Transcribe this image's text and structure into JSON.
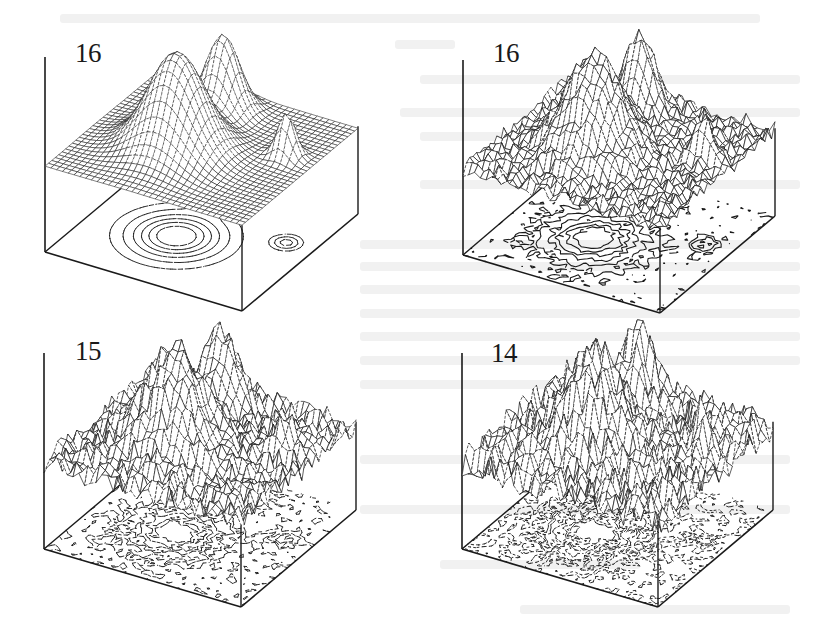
{
  "figure": {
    "type": "3d-surface-grid",
    "panels": [
      {
        "id": "top-left",
        "label": "16",
        "noise": 0.0,
        "contour_style": "dashed",
        "surface_style": "smooth-grid",
        "origin": [
          0,
          0
        ],
        "box": {
          "left": [
            45,
            252
          ],
          "front": [
            242,
            311
          ],
          "right": [
            358,
            214
          ],
          "back": [
            161,
            155
          ],
          "height": 195
        },
        "plane_z": 0.44,
        "label_pos": [
          75,
          40
        ]
      },
      {
        "id": "top-right",
        "label": "16",
        "noise": 0.09,
        "contour_style": "solid",
        "surface_style": "noisy-mesh",
        "origin": [
          418,
          0
        ],
        "box": {
          "left": [
            45,
            255
          ],
          "front": [
            242,
            313
          ],
          "right": [
            357,
            216
          ],
          "back": [
            160,
            157
          ],
          "height": 195
        },
        "plane_z": 0.44,
        "label_pos": [
          75,
          40
        ]
      },
      {
        "id": "bottom-left",
        "label": "15",
        "noise": 0.13,
        "contour_style": "fine-dashed",
        "surface_style": "noisy-mesh",
        "origin": [
          0,
          296
        ],
        "box": {
          "left": [
            44,
            253
          ],
          "front": [
            241,
            311
          ],
          "right": [
            356,
            214
          ],
          "back": [
            159,
            156
          ],
          "height": 196
        },
        "plane_z": 0.44,
        "label_pos": [
          75,
          42
        ]
      },
      {
        "id": "bottom-right",
        "label": "14",
        "noise": 0.18,
        "contour_style": "speckled",
        "surface_style": "noisy-mesh",
        "origin": [
          418,
          296
        ],
        "box": {
          "left": [
            44,
            253
          ],
          "front": [
            240,
            311
          ],
          "right": [
            355,
            214
          ],
          "back": [
            159,
            156
          ],
          "height": 196
        },
        "plane_z": 0.44,
        "label_pos": [
          73,
          44
        ]
      }
    ],
    "peaks": [
      {
        "u": 0.42,
        "v": 0.42,
        "height": 1.0,
        "width": 0.13
      },
      {
        "u": 0.42,
        "v": 0.82,
        "height": 0.78,
        "width": 0.075
      },
      {
        "u": 0.86,
        "v": 0.62,
        "height": 0.45,
        "width": 0.04
      }
    ],
    "grid_resolution": 34,
    "colors": {
      "ink": "#1a1a1a",
      "paper": "#ffffff",
      "bleed_through": "#f1f1f1"
    }
  }
}
